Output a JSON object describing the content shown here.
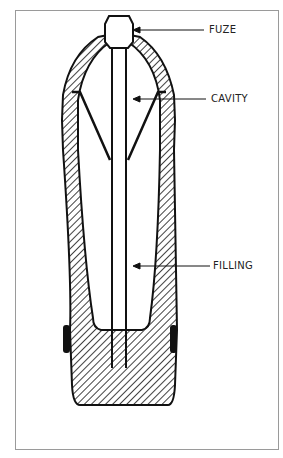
{
  "figure": {
    "labels": {
      "fuze": "FUZE",
      "cavity": "CAVITY",
      "filling": "FILLING"
    },
    "colors": {
      "ink": "#111111",
      "border": "#9a9a9a",
      "background": "#ffffff"
    }
  }
}
